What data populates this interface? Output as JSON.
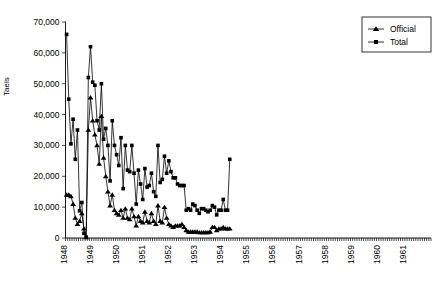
{
  "chart": {
    "ylabel": "Taels",
    "y_ticks": [
      "0",
      "10,000",
      "20,000",
      "30,000",
      "40,000",
      "50,000",
      "60,000",
      "70,000"
    ],
    "x_year_labels": [
      "1948",
      "1949",
      "1950",
      "1951",
      "1952",
      "1953",
      "1954",
      "1955",
      "1956",
      "1957",
      "1958",
      "1959",
      "1960",
      "1961"
    ],
    "legend": {
      "official_label": "Official",
      "total_label": "Total"
    }
  },
  "chart_data": {
    "type": "line",
    "title": "",
    "xlabel": "",
    "ylabel": "Taels",
    "ylim": [
      0,
      70000
    ],
    "ytick_step": 10000,
    "grid": false,
    "legend_position": "top-right",
    "x_start_year": 1948,
    "x_end_year": 1961,
    "x_tick_interval": "month",
    "x_labels": [
      "1948",
      "1949",
      "1950",
      "1951",
      "1952",
      "1953",
      "1954",
      "1955",
      "1956",
      "1957",
      "1958",
      "1959",
      "1960",
      "1961"
    ],
    "series": [
      {
        "name": "Total",
        "marker": "square",
        "values": [
          66000,
          45000,
          30500,
          38500,
          25500,
          35000,
          8800,
          11500,
          1500,
          300,
          52000,
          62000,
          50500,
          49500,
          38000,
          35000,
          50000,
          32000,
          35500,
          30000,
          18500,
          38000,
          30000,
          27000,
          23500,
          32500,
          16000,
          30000,
          22000,
          21500,
          30000,
          21000,
          11000,
          22000,
          17500,
          12500,
          22500,
          16500,
          17000,
          21000,
          15000,
          13500,
          30000,
          18000,
          19000,
          26500,
          21000,
          25000,
          21500,
          19500,
          19500,
          17500,
          17000,
          17000,
          17000,
          9000,
          9500,
          9000,
          11000,
          10500,
          9000,
          8000,
          9500,
          9500,
          9000,
          8500,
          9000,
          10500,
          10000,
          7500,
          9000,
          9000,
          12500,
          9000,
          9000,
          25500
        ]
      },
      {
        "name": "Official",
        "marker": "triangle",
        "values": [
          14000,
          14000,
          13500,
          11000,
          6500,
          4500,
          5500,
          8000,
          3000,
          200,
          35000,
          45500,
          38000,
          33500,
          30000,
          24000,
          39500,
          26000,
          20000,
          15000,
          10500,
          14000,
          9000,
          8000,
          7500,
          9000,
          6500,
          9500,
          6500,
          6000,
          9500,
          7000,
          4000,
          7000,
          5500,
          5000,
          8500,
          5500,
          5000,
          8000,
          5500,
          4500,
          10500,
          5500,
          5000,
          10000,
          6500,
          4500,
          4000,
          3500,
          4000,
          4000,
          4000,
          4500,
          3500,
          2500,
          2000,
          2000,
          2000,
          2000,
          2000,
          1800,
          1800,
          1800,
          1800,
          1800,
          2000,
          3500,
          3500,
          2500,
          3000,
          3000,
          3500,
          3000,
          3000,
          3000
        ]
      }
    ]
  }
}
